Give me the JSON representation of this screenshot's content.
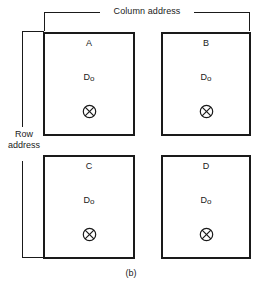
{
  "figure": {
    "caption": "(b)",
    "column_axis_label": "Column address",
    "row_axis_label_line1": "Row",
    "row_axis_label_line2": "address",
    "line_color": "#1a1a1a",
    "background_color": "#ffffff"
  },
  "cells": [
    {
      "letter": "A",
      "value": "D",
      "subscript": "o",
      "symbol": "crossed-circle"
    },
    {
      "letter": "B",
      "value": "D",
      "subscript": "o",
      "symbol": "crossed-circle"
    },
    {
      "letter": "C",
      "value": "D",
      "subscript": "o",
      "symbol": "crossed-circle"
    },
    {
      "letter": "D",
      "value": "D",
      "subscript": "o",
      "symbol": "crossed-circle"
    }
  ]
}
